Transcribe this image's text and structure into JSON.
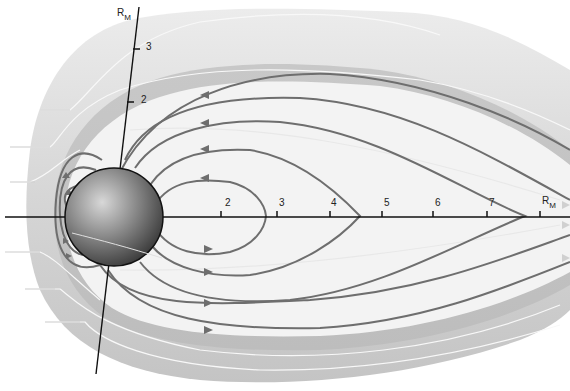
{
  "diagram": {
    "planet_label": "planet",
    "axis_unit_label": "R",
    "axis_unit_subscript": "M",
    "horizontal_axis": {
      "ticks": [
        {
          "label": "2",
          "x": 221
        },
        {
          "label": "3",
          "x": 277
        },
        {
          "label": "4",
          "x": 330
        },
        {
          "label": "5",
          "x": 382
        },
        {
          "label": "6",
          "x": 433
        },
        {
          "label": "7",
          "x": 487
        }
      ],
      "unit_label_x": 540
    },
    "vertical_axis": {
      "ticks": [
        {
          "label": "3",
          "y": 49
        },
        {
          "label": "2",
          "y": 102
        }
      ]
    },
    "colors": {
      "field_line": "#6e6e6e",
      "axis": "#111111",
      "magnetosheath_outer": "#e6e6e6",
      "magnetosheath_inner": "#cfcfcf",
      "cavity": "#f2f2f2",
      "solar_wind": "#d9d9d9"
    }
  }
}
